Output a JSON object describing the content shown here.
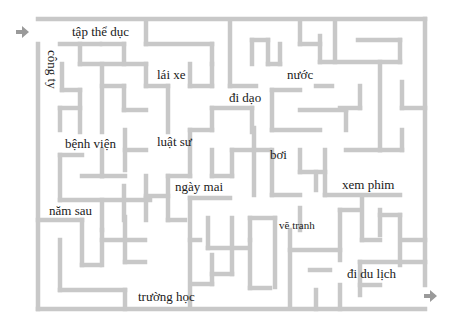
{
  "maze": {
    "wall_color": "#c8c8c8",
    "wall_width": 4.5,
    "arrow_color": "#9a9a9a",
    "entry_arrow": {
      "x": 22,
      "y": 32,
      "direction": "right"
    },
    "exit_arrow": {
      "x": 430,
      "y": 296,
      "direction": "right"
    },
    "walls": [
      [
        38,
        19,
        425,
        19
      ],
      [
        38,
        44,
        38,
        309
      ],
      [
        425,
        19,
        425,
        285
      ],
      [
        38,
        309,
        425,
        309
      ],
      [
        60,
        44,
        100,
        44
      ],
      [
        80,
        44,
        80,
        64
      ],
      [
        80,
        64,
        146,
        64
      ],
      [
        102,
        44,
        124,
        44
      ],
      [
        124,
        44,
        124,
        64
      ],
      [
        146,
        20,
        146,
        44
      ],
      [
        146,
        44,
        212,
        44
      ],
      [
        212,
        44,
        212,
        64
      ],
      [
        62,
        64,
        62,
        90
      ],
      [
        62,
        90,
        80,
        90
      ],
      [
        80,
        90,
        80,
        132
      ],
      [
        102,
        64,
        102,
        132
      ],
      [
        102,
        86,
        124,
        86
      ],
      [
        124,
        86,
        124,
        110
      ],
      [
        124,
        110,
        146,
        110
      ],
      [
        146,
        64,
        146,
        86
      ],
      [
        146,
        86,
        168,
        86
      ],
      [
        168,
        86,
        168,
        132
      ],
      [
        190,
        64,
        190,
        86
      ],
      [
        190,
        86,
        212,
        86
      ],
      [
        212,
        64,
        212,
        86
      ],
      [
        230,
        20,
        230,
        86
      ],
      [
        230,
        86,
        256,
        86
      ],
      [
        252,
        40,
        252,
        64
      ],
      [
        252,
        40,
        268,
        40
      ],
      [
        268,
        40,
        268,
        64
      ],
      [
        268,
        64,
        280,
        64
      ],
      [
        280,
        64,
        280,
        44
      ],
      [
        300,
        20,
        300,
        44
      ],
      [
        300,
        44,
        320,
        44
      ],
      [
        320,
        36,
        320,
        62
      ],
      [
        320,
        62,
        400,
        62
      ],
      [
        335,
        20,
        335,
        62
      ],
      [
        358,
        40,
        400,
        40
      ],
      [
        400,
        40,
        400,
        62
      ],
      [
        380,
        62,
        380,
        150
      ],
      [
        402,
        82,
        402,
        108
      ],
      [
        402,
        108,
        425,
        108
      ],
      [
        212,
        108,
        212,
        130
      ],
      [
        212,
        108,
        252,
        108
      ],
      [
        252,
        108,
        252,
        132
      ],
      [
        272,
        90,
        272,
        130
      ],
      [
        272,
        90,
        300,
        90
      ],
      [
        272,
        130,
        320,
        130
      ],
      [
        300,
        110,
        346,
        110
      ],
      [
        346,
        110,
        346,
        130
      ],
      [
        316,
        86,
        332,
        86
      ],
      [
        360,
        86,
        360,
        108
      ],
      [
        360,
        108,
        340,
        108
      ],
      [
        60,
        108,
        80,
        108
      ],
      [
        60,
        108,
        60,
        130
      ],
      [
        125,
        130,
        125,
        170
      ],
      [
        125,
        150,
        146,
        150
      ],
      [
        102,
        150,
        102,
        176
      ],
      [
        102,
        176,
        125,
        176
      ],
      [
        190,
        130,
        190,
        176
      ],
      [
        190,
        130,
        212,
        130
      ],
      [
        212,
        150,
        212,
        176
      ],
      [
        212,
        176,
        232,
        176
      ],
      [
        232,
        150,
        232,
        176
      ],
      [
        232,
        150,
        254,
        150
      ],
      [
        254,
        128,
        254,
        195
      ],
      [
        254,
        150,
        270,
        150
      ],
      [
        272,
        150,
        272,
        195
      ],
      [
        272,
        195,
        300,
        195
      ],
      [
        300,
        150,
        300,
        172
      ],
      [
        300,
        172,
        325,
        172
      ],
      [
        325,
        150,
        325,
        195
      ],
      [
        346,
        150,
        380,
        150
      ],
      [
        380,
        150,
        402,
        150
      ],
      [
        402,
        130,
        402,
        150
      ],
      [
        316,
        172,
        316,
        190
      ],
      [
        325,
        195,
        400,
        195
      ],
      [
        60,
        155,
        82,
        155
      ],
      [
        60,
        155,
        60,
        200
      ],
      [
        60,
        200,
        150,
        200
      ],
      [
        82,
        176,
        102,
        176
      ],
      [
        102,
        200,
        102,
        230
      ],
      [
        124,
        186,
        124,
        220
      ],
      [
        146,
        176,
        146,
        196
      ],
      [
        146,
        196,
        168,
        196
      ],
      [
        168,
        176,
        168,
        220
      ],
      [
        168,
        176,
        190,
        176
      ],
      [
        168,
        220,
        185,
        220
      ],
      [
        38,
        220,
        82,
        220
      ],
      [
        82,
        220,
        82,
        265
      ],
      [
        82,
        265,
        100,
        265
      ],
      [
        60,
        240,
        60,
        290
      ],
      [
        60,
        290,
        125,
        290
      ],
      [
        125,
        290,
        125,
        309
      ],
      [
        102,
        230,
        102,
        265
      ],
      [
        102,
        240,
        145,
        240
      ],
      [
        125,
        217,
        125,
        262
      ],
      [
        125,
        262,
        145,
        262
      ],
      [
        146,
        198,
        146,
        220
      ],
      [
        190,
        198,
        190,
        308
      ],
      [
        190,
        198,
        230,
        198
      ],
      [
        190,
        240,
        200,
        240
      ],
      [
        208,
        218,
        208,
        248
      ],
      [
        208,
        248,
        248,
        248
      ],
      [
        232,
        218,
        232,
        274
      ],
      [
        232,
        274,
        212,
        274
      ],
      [
        212,
        255,
        212,
        284
      ],
      [
        192,
        284,
        212,
        284
      ],
      [
        250,
        218,
        250,
        240
      ],
      [
        250,
        218,
        275,
        218
      ],
      [
        275,
        218,
        275,
        287
      ],
      [
        250,
        240,
        250,
        288
      ],
      [
        250,
        288,
        270,
        288
      ],
      [
        290,
        230,
        290,
        308
      ],
      [
        290,
        250,
        340,
        250
      ],
      [
        300,
        208,
        300,
        230
      ],
      [
        310,
        270,
        330,
        270
      ],
      [
        340,
        210,
        340,
        260
      ],
      [
        340,
        210,
        360,
        210
      ],
      [
        362,
        196,
        362,
        240
      ],
      [
        362,
        240,
        380,
        240
      ],
      [
        380,
        210,
        380,
        235
      ],
      [
        380,
        215,
        400,
        215
      ],
      [
        400,
        215,
        400,
        265
      ],
      [
        360,
        262,
        425,
        262
      ],
      [
        360,
        262,
        360,
        295
      ],
      [
        360,
        285,
        380,
        285
      ],
      [
        402,
        240,
        425,
        240
      ],
      [
        340,
        285,
        340,
        309
      ],
      [
        316,
        290,
        316,
        309
      ]
    ]
  },
  "words": [
    {
      "id": "tap-the-duc",
      "text": "tập thể dục",
      "x": 72,
      "y": 25,
      "orientation": "horizontal"
    },
    {
      "id": "cong-ty",
      "text": "công ty",
      "x": 59,
      "y": 50,
      "orientation": "vertical"
    },
    {
      "id": "lai-xe",
      "text": "lái xe",
      "x": 157,
      "y": 68,
      "orientation": "horizontal"
    },
    {
      "id": "nuoc",
      "text": "nước",
      "x": 287,
      "y": 68,
      "orientation": "horizontal"
    },
    {
      "id": "di-dao",
      "text": "đi dạo",
      "x": 229,
      "y": 91,
      "orientation": "horizontal"
    },
    {
      "id": "benh-vien",
      "text": "bệnh viện",
      "x": 65,
      "y": 137,
      "orientation": "horizontal"
    },
    {
      "id": "luat-su",
      "text": "luật sư",
      "x": 157,
      "y": 135,
      "orientation": "horizontal"
    },
    {
      "id": "boi",
      "text": "bơi",
      "x": 270,
      "y": 148,
      "orientation": "horizontal"
    },
    {
      "id": "ngay-mai",
      "text": "ngày mai",
      "x": 175,
      "y": 180,
      "orientation": "horizontal"
    },
    {
      "id": "xem-phim",
      "text": "xem phim",
      "x": 342,
      "y": 178,
      "orientation": "horizontal"
    },
    {
      "id": "nam-sau",
      "text": "năm sau",
      "x": 49,
      "y": 204,
      "orientation": "horizontal"
    },
    {
      "id": "ve-tranh",
      "text": "vẽ tranh",
      "x": 279,
      "y": 220,
      "orientation": "horizontal",
      "size": "small"
    },
    {
      "id": "di-du-lich",
      "text": "đi du lịch",
      "x": 347,
      "y": 267,
      "orientation": "horizontal"
    },
    {
      "id": "truong-hoc",
      "text": "trường học",
      "x": 138,
      "y": 290,
      "orientation": "horizontal"
    }
  ]
}
